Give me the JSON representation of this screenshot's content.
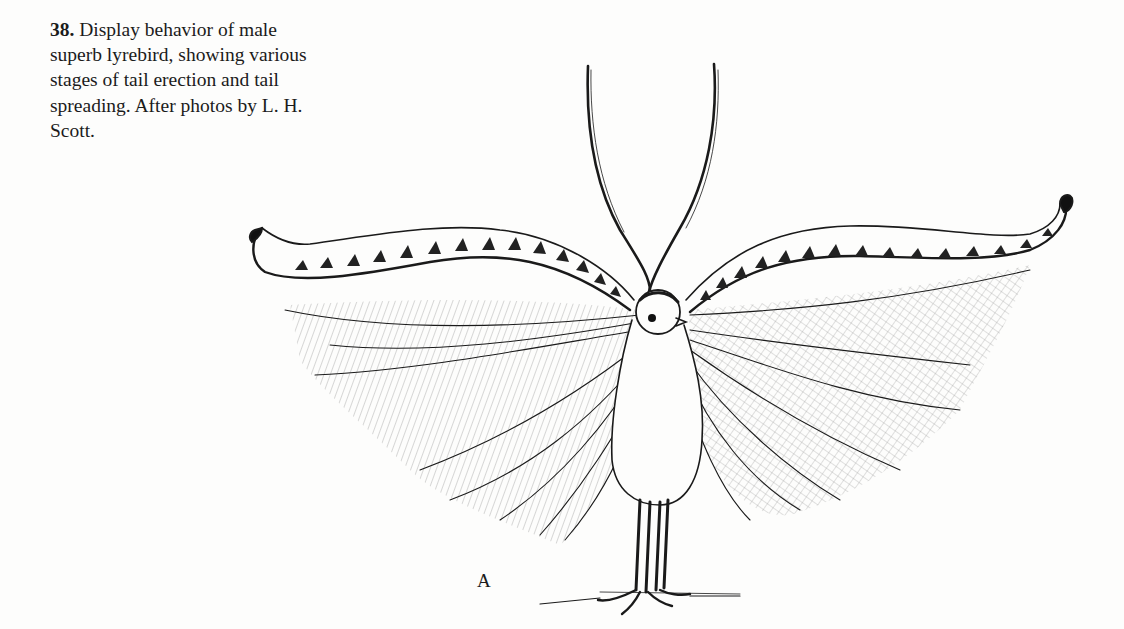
{
  "figure": {
    "number": "38.",
    "caption_lines": [
      "Display behavior of male",
      "superb lyrebird, showing various",
      "stages of tail erection and tail",
      "spreading. After photos by L. H.",
      "Scott."
    ],
    "caption_full": "Display behavior of male superb lyrebird, showing various stages of tail erection and tail spreading. After photos by L. H. Scott.",
    "panel_label": "A",
    "illustration": "pen-and-ink drawing of a male superb lyrebird facing forward with lyrate outer tail feathers spread sideways, two thin median tail plumes crossed above the head, and filamentous feathers fanned out on both sides",
    "colors": {
      "ink": "#1a1a1a",
      "paper": "#fdfdfc"
    }
  }
}
